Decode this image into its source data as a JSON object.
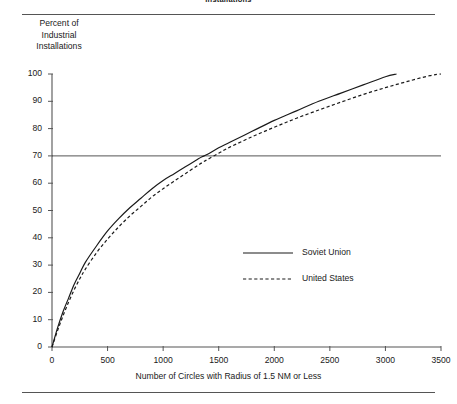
{
  "figure": {
    "clipped_header_text": "Installations",
    "rules": [
      "top-rule",
      "bottom-rule"
    ]
  },
  "chart_data": {
    "type": "line",
    "title": "",
    "subtitle": "",
    "xlabel": "Number of Circles with Radius of 1.5 NM or Less",
    "ylabel_lines": [
      "Percent of",
      "Industrial",
      "Installations"
    ],
    "ylabel": "Percent of Industrial Installations",
    "xlim": [
      0,
      3500
    ],
    "ylim": [
      0,
      100
    ],
    "xticks": [
      0,
      500,
      1000,
      1500,
      2000,
      2500,
      3000,
      3500
    ],
    "xtick_labels": [
      "0",
      "500",
      "1000",
      "1500",
      "2000",
      "2500",
      "3000",
      "3500"
    ],
    "yticks": [
      0,
      10,
      20,
      30,
      40,
      50,
      60,
      70,
      80,
      90,
      100
    ],
    "ytick_labels": [
      "0",
      "10",
      "20",
      "30",
      "40",
      "50",
      "60",
      "70",
      "80",
      "90",
      "100"
    ],
    "grid": false,
    "reference_lines": [
      {
        "name": "seventy-percent-line",
        "axis": "y",
        "value": 70,
        "style": "solid",
        "color": "#555555"
      }
    ],
    "legend_position": "center-right-inside",
    "series": [
      {
        "name": "Soviet Union",
        "style": "solid",
        "color": "#1a1a1a",
        "x": [
          0,
          50,
          100,
          150,
          200,
          250,
          300,
          400,
          500,
          600,
          700,
          800,
          900,
          1000,
          1100,
          1200,
          1300,
          1350,
          1400,
          1500,
          1600,
          1800,
          2000,
          2200,
          2400,
          2600,
          2800,
          3000,
          3100
        ],
        "y": [
          0,
          7,
          13,
          18,
          23,
          27,
          31,
          37,
          42.5,
          47,
          51,
          54.5,
          58,
          61,
          63.5,
          66,
          68.5,
          69.7,
          70.6,
          73,
          75,
          79,
          83,
          86.5,
          90,
          93,
          96,
          99,
          100
        ]
      },
      {
        "name": "United States",
        "style": "dashed",
        "color": "#1a1a1a",
        "x": [
          0,
          50,
          100,
          150,
          200,
          250,
          300,
          400,
          500,
          600,
          700,
          800,
          900,
          1000,
          1100,
          1200,
          1300,
          1350,
          1400,
          1500,
          1600,
          1800,
          2000,
          2200,
          2400,
          2600,
          2800,
          3000,
          3200,
          3400,
          3500
        ],
        "y": [
          0,
          6,
          11.5,
          16.5,
          21,
          25,
          28.5,
          34.5,
          39.5,
          44,
          48,
          51.5,
          55,
          58,
          60.8,
          63.5,
          66.2,
          67.5,
          68.7,
          71,
          73.2,
          77,
          80.5,
          83.8,
          86.8,
          89.7,
          92.5,
          95,
          97.3,
          99.4,
          100
        ]
      }
    ],
    "annotations": []
  },
  "legend": {
    "items": [
      {
        "label": "Soviet Union",
        "style": "solid"
      },
      {
        "label": "United States",
        "style": "dashed"
      }
    ]
  }
}
